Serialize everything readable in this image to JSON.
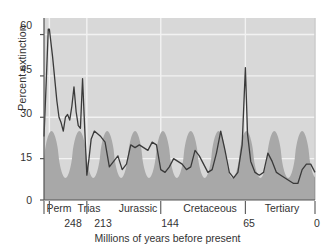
{
  "chart_data": {
    "type": "area",
    "title": "",
    "xlabel": "Millions of years before present",
    "ylabel": "Percent extinction",
    "xlim": [
      253,
      0
    ],
    "ylim": [
      0,
      66
    ],
    "yticks": [
      0,
      15,
      30,
      45,
      60
    ],
    "ytick_labels": [
      "0",
      "15",
      "30",
      "45",
      "60"
    ],
    "xticks": [
      248,
      213,
      144,
      65,
      0
    ],
    "xtick_labels": [
      "248",
      "213",
      "144",
      "65",
      "0"
    ],
    "grid": "white gridlines on gray panel",
    "legend": "none",
    "series": [
      {
        "name": "Percent extinction",
        "type": "line",
        "color": "#3a3a3a",
        "x": [
          253,
          251,
          249,
          248,
          245,
          243,
          241,
          239,
          237,
          235,
          233,
          231,
          229,
          227,
          225,
          223,
          221,
          219,
          217,
          215,
          213,
          211,
          209,
          206,
          203,
          200,
          196,
          192,
          188,
          184,
          180,
          176,
          172,
          168,
          164,
          160,
          156,
          152,
          148,
          144,
          140,
          136,
          132,
          128,
          124,
          120,
          116,
          112,
          108,
          104,
          100,
          96,
          92,
          88,
          84,
          80,
          76,
          72,
          68,
          65,
          63,
          60,
          56,
          52,
          48,
          44,
          40,
          36,
          32,
          28,
          24,
          20,
          16,
          12,
          8,
          4,
          0
        ],
        "y": [
          23,
          42,
          62,
          62,
          52,
          44,
          36,
          30,
          28,
          25,
          30,
          31,
          29,
          34,
          41,
          32,
          27,
          26,
          44,
          26,
          9,
          15,
          22,
          25,
          24,
          23,
          21,
          12,
          14,
          16,
          11,
          13,
          20,
          19,
          20,
          19,
          18,
          21,
          20,
          11,
          10,
          12,
          15,
          14,
          13,
          11,
          12,
          18,
          16,
          13,
          10,
          11,
          17,
          25,
          18,
          10,
          8,
          10,
          20,
          48,
          24,
          14,
          10,
          9,
          10,
          17,
          14,
          10,
          9,
          8,
          7,
          6,
          6,
          11,
          13,
          13,
          10
        ]
      },
      {
        "name": "26 million year periodic band",
        "type": "area",
        "color": "#a8a8a8",
        "description": "shaded sinusoidal band peaking about every 26 million years, between 8 and 25 percent"
      }
    ],
    "eras": [
      {
        "label": "Perm",
        "start": 253,
        "end": 248
      },
      {
        "label": "Trias",
        "start": 248,
        "end": 213
      },
      {
        "label": "Jurassic",
        "start": 213,
        "end": 144
      },
      {
        "label": "Cretaceous",
        "start": 144,
        "end": 65
      },
      {
        "label": "Tertiary",
        "start": 65,
        "end": 0
      }
    ]
  },
  "colors": {
    "panel": "#d8d8d8",
    "band": "#a9a9a9",
    "line": "#3d3d3d",
    "grid": "#f2f2f2",
    "text": "#333333",
    "axis": "#555555",
    "background": "#ffffff"
  }
}
